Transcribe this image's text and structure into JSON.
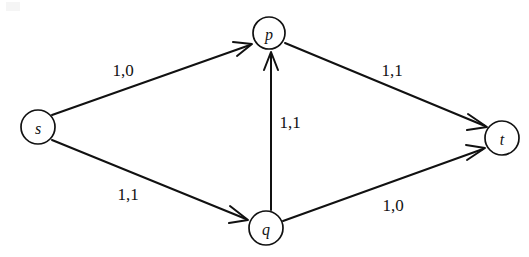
{
  "diagram": {
    "background_color": "#ffffff",
    "ink_color": "#111111",
    "nodes": [
      {
        "id": "s",
        "label": "s",
        "cx": 38,
        "cy": 127,
        "r": 17
      },
      {
        "id": "p",
        "label": "p",
        "cx": 269,
        "cy": 33,
        "r": 16
      },
      {
        "id": "q",
        "label": "q",
        "cx": 266,
        "cy": 228,
        "r": 17
      },
      {
        "id": "t",
        "label": "t",
        "cx": 502,
        "cy": 138,
        "r": 17
      }
    ],
    "edges": [
      {
        "id": "s-p",
        "from": "s",
        "to": "p",
        "label": "1,0",
        "label_x": 123,
        "label_y": 70,
        "capacity": 1,
        "flow": 0
      },
      {
        "id": "s-q",
        "from": "s",
        "to": "q",
        "label": "1,1",
        "label_x": 128,
        "label_y": 194,
        "capacity": 1,
        "flow": 1
      },
      {
        "id": "q-p",
        "from": "q",
        "to": "p",
        "label": "1,1",
        "label_x": 290,
        "label_y": 122,
        "capacity": 1,
        "flow": 1
      },
      {
        "id": "p-t",
        "from": "p",
        "to": "t",
        "label": "1,1",
        "label_x": 392,
        "label_y": 70,
        "capacity": 1,
        "flow": 1
      },
      {
        "id": "q-t",
        "from": "q",
        "to": "t",
        "label": "1,0",
        "label_x": 393,
        "label_y": 205,
        "capacity": 1,
        "flow": 0
      }
    ]
  }
}
